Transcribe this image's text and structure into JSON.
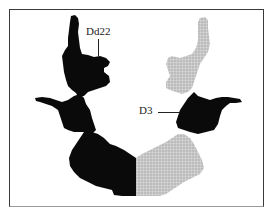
{
  "figure": {
    "type": "Rorschach inkblot location diagram",
    "colors": {
      "highlighted_region": "#0a0a0a",
      "other_region": "#c6c6c6",
      "frame": "#3a3a3a",
      "background": "#ffffff"
    },
    "labels": [
      {
        "id": "dd22",
        "text": "Dd22",
        "target": "upper-left black hand-shaped detail"
      },
      {
        "id": "d3",
        "text": "D3",
        "target": "middle-right black lateral detail"
      }
    ],
    "regions": {
      "left_half": "black (highlighted)",
      "right_half_upper": "gray stippled",
      "right_half_middle": "black (D3)",
      "right_half_lower": "gray stippled"
    }
  }
}
